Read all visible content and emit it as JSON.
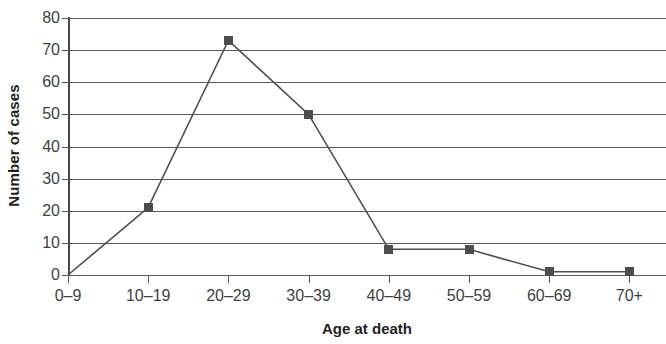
{
  "chart_data": {
    "type": "line",
    "title": "",
    "xlabel": "Age at death",
    "ylabel": "Number of cases",
    "categories": [
      "0–9",
      "10–19",
      "20–29",
      "30–39",
      "40–49",
      "50–59",
      "60–69",
      "70+"
    ],
    "values": [
      0,
      21,
      73,
      50,
      8,
      8,
      1,
      1
    ],
    "ylim": [
      0,
      80
    ],
    "yticks": [
      0,
      10,
      20,
      30,
      40,
      50,
      60,
      70,
      80
    ],
    "ytick_labels": [
      "0",
      "10",
      "20",
      "30",
      "40",
      "50",
      "60",
      "70",
      "80"
    ],
    "grid": "horizontal",
    "legend": "none",
    "marker": "square",
    "series_color": "#4d4d4f",
    "grid_color": "#58595b",
    "axis_color": "#4a4a4c",
    "text_color": "#231f20",
    "background": "#ffffff"
  }
}
